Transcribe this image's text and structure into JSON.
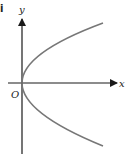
{
  "part_label": "i",
  "axes": {
    "x_label": "x",
    "y_label": "y",
    "origin_label": "O"
  },
  "curve": {
    "description": "parabola opening to the right with vertex at origin (x = k y^2)",
    "color": "#777777"
  },
  "colors": {
    "axis": "#1a1a1a",
    "curve": "#777777",
    "background": "#ffffff"
  }
}
